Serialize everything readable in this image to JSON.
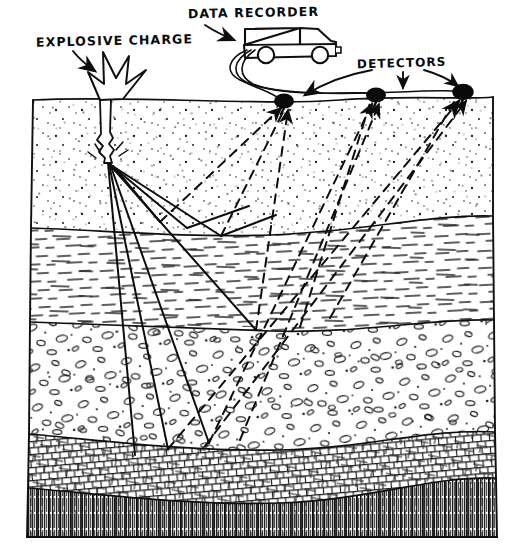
{
  "figure": {
    "style": "hand-drawn ink line art, black on white",
    "width": 521,
    "height": 550,
    "ink_color": "#111111",
    "paper_color": "#ffffff"
  },
  "labels": {
    "explosive_charge": "EXPLOSIVE CHARGE",
    "data_recorder": "DATA RECORDER",
    "detectors": "DETECTORS"
  },
  "surface": {
    "name": "ground-surface",
    "y_left": 100,
    "y_right": 97
  },
  "source": {
    "name": "shot-point",
    "x": 108,
    "y": 163,
    "borehole_top_x": 104,
    "borehole_top_y": 100,
    "blast_description": "jagged star burst above borehole"
  },
  "truck": {
    "name": "data-recorder-truck",
    "x": 243,
    "y": 28,
    "width": 92,
    "height": 38,
    "wheels": 2,
    "cable_count": 3
  },
  "detectors": [
    {
      "name": "detector-1",
      "x": 284,
      "y": 102,
      "rx": 10,
      "ry": 8
    },
    {
      "name": "detector-2",
      "x": 376,
      "y": 96,
      "rx": 10,
      "ry": 8
    },
    {
      "name": "detector-3",
      "x": 463,
      "y": 93,
      "rx": 11,
      "ry": 9
    }
  ],
  "strata": [
    {
      "index": 1,
      "name": "soil-sand-layer",
      "pattern": "stipple-dots",
      "top_y": 100,
      "bottom_y": 228,
      "description": "unconsolidated surface soil / sand, fine dot stipple"
    },
    {
      "index": 2,
      "name": "shale-layer",
      "pattern": "horizontal-dashes",
      "top_y": 228,
      "bottom_y": 327,
      "description": "bedded shale, short horizontal dash texture"
    },
    {
      "index": 3,
      "name": "conglomerate-layer",
      "pattern": "pebble-ovals",
      "top_y": 327,
      "bottom_y": 440,
      "description": "conglomerate with rounded pebble outlines"
    },
    {
      "index": 4,
      "name": "limestone-layer",
      "pattern": "brick-crosshatch",
      "top_y": 440,
      "bottom_y": 492,
      "description": "blocky brick / crosshatch fractured rock band"
    },
    {
      "index": 5,
      "name": "bedrock-basement",
      "pattern": "dense-vertical-hatch",
      "top_y": 492,
      "bottom_y": 537,
      "description": "crystalline basement, dense vertical hatching"
    }
  ],
  "ray_paths": {
    "downgoing": {
      "name": "incident-rays",
      "style": "solid",
      "count": 6,
      "description": "solid rays fan downward from shot point to reflecting interfaces"
    },
    "upgoing": {
      "name": "reflected-rays",
      "style": "dashed",
      "count": 6,
      "description": "dashed rays travel upward from interfaces to the detectors"
    }
  },
  "annotations": {
    "explosive_arrow": "arrow from EXPLOSIVE CHARGE label down-right to the blast",
    "recorder_arrow": "arrow from DATA RECORDER label down-right to the truck",
    "detector_arrows": "three arrows from DETECTORS label to each detector"
  }
}
